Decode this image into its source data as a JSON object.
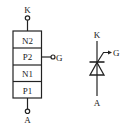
{
  "diagram": {
    "colors": {
      "stroke": "#222222",
      "background": "#ffffff"
    },
    "structure": {
      "terminal_top": "K",
      "terminal_bottom": "A",
      "terminal_gate": "G",
      "layers": [
        {
          "label": "N2"
        },
        {
          "label": "P2"
        },
        {
          "label": "N1"
        },
        {
          "label": "P1"
        }
      ]
    },
    "symbol": {
      "terminal_top": "K",
      "terminal_bottom": "A",
      "terminal_gate": "G",
      "icon": "thyristor-symbol"
    }
  }
}
